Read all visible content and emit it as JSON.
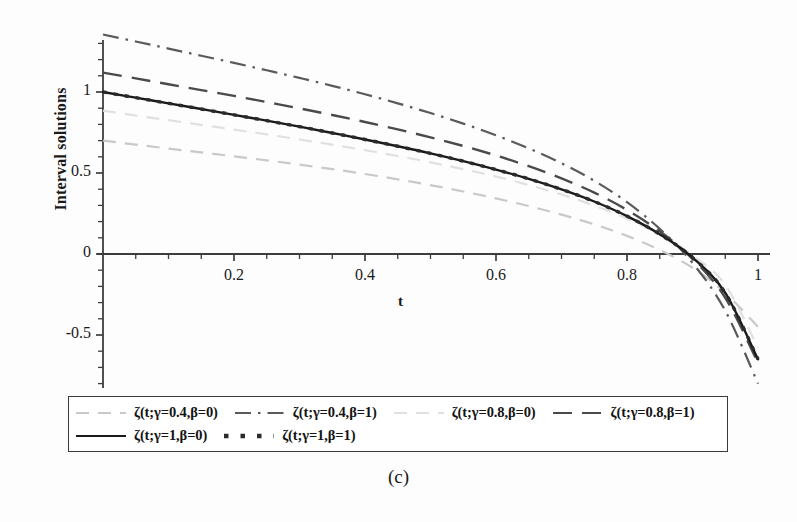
{
  "figure": {
    "caption": "(c)"
  },
  "chart_data": {
    "type": "line",
    "title": "",
    "xlabel": "t",
    "ylabel": "Interval solutions",
    "xlim": [
      0,
      1.02
    ],
    "ylim": [
      -0.86,
      1.42
    ],
    "grid": false,
    "legend_position": "bottom",
    "xticks": [
      {
        "value": 0.2,
        "label": "0.2"
      },
      {
        "value": 0.4,
        "label": "0.4"
      },
      {
        "value": 0.6,
        "label": "0.6"
      },
      {
        "value": 0.8,
        "label": "0.8"
      },
      {
        "value": 1.0,
        "label": "1"
      }
    ],
    "yticks": [
      {
        "value": 1.0,
        "label": "1"
      },
      {
        "value": 0.5,
        "label": "0.5"
      },
      {
        "value": 0.0,
        "label": "0"
      },
      {
        "value": -0.5,
        "label": "-0.5"
      }
    ],
    "x": [
      0,
      0.05,
      0.1,
      0.15,
      0.2,
      0.25,
      0.3,
      0.35,
      0.4,
      0.45,
      0.5,
      0.55,
      0.6,
      0.65,
      0.7,
      0.75,
      0.8,
      0.85,
      0.9,
      0.95,
      1.0
    ],
    "series": [
      {
        "name": "ζ(t;γ=0.4,β=0)",
        "style": "dashed",
        "color": "#c9c9c9",
        "width": 2.2,
        "values": [
          0.7,
          0.675,
          0.651,
          0.627,
          0.603,
          0.578,
          0.552,
          0.524,
          0.494,
          0.461,
          0.425,
          0.386,
          0.343,
          0.296,
          0.243,
          0.183,
          0.112,
          0.025,
          -0.085,
          -0.24,
          -0.45
        ]
      },
      {
        "name": "ζ(t;γ=0.4,β=1)",
        "style": "dashdot",
        "color": "#5a5a5a",
        "width": 2.2,
        "values": [
          1.355,
          1.312,
          1.268,
          1.224,
          1.18,
          1.134,
          1.087,
          1.038,
          0.986,
          0.93,
          0.87,
          0.805,
          0.733,
          0.652,
          0.56,
          0.452,
          0.32,
          0.155,
          -0.055,
          -0.35,
          -0.8
        ]
      },
      {
        "name": "ζ(t;γ=0.8,β=0)",
        "style": "dashed",
        "color": "#e0e0e0",
        "width": 2.2,
        "values": [
          0.885,
          0.855,
          0.826,
          0.797,
          0.768,
          0.738,
          0.707,
          0.675,
          0.641,
          0.605,
          0.566,
          0.524,
          0.478,
          0.426,
          0.367,
          0.299,
          0.218,
          0.118,
          -0.01,
          -0.19,
          -0.58
        ]
      },
      {
        "name": "ζ(t;γ=0.8,β=1)",
        "style": "longdash",
        "color": "#4a4a4a",
        "width": 2.4,
        "values": [
          1.12,
          1.084,
          1.048,
          1.012,
          0.976,
          0.938,
          0.899,
          0.858,
          0.815,
          0.769,
          0.72,
          0.667,
          0.608,
          0.542,
          0.467,
          0.379,
          0.272,
          0.14,
          -0.03,
          -0.27,
          -0.672
        ]
      },
      {
        "name": "ζ(t;γ=1,β=0)",
        "style": "solid",
        "color": "#1a1a1a",
        "width": 2.4,
        "values": [
          1.0,
          0.965,
          0.93,
          0.895,
          0.859,
          0.823,
          0.786,
          0.747,
          0.707,
          0.665,
          0.621,
          0.573,
          0.521,
          0.464,
          0.399,
          0.324,
          0.234,
          0.122,
          -0.022,
          -0.24,
          -0.65
        ]
      },
      {
        "name": "ζ(t;γ=1,β=1)",
        "style": "dotted-square",
        "color": "#2b2b2b",
        "width": 3.4,
        "values": [
          1.0,
          0.965,
          0.93,
          0.895,
          0.859,
          0.823,
          0.786,
          0.747,
          0.707,
          0.665,
          0.621,
          0.573,
          0.521,
          0.464,
          0.399,
          0.324,
          0.234,
          0.122,
          -0.022,
          -0.24,
          -0.65
        ]
      }
    ]
  },
  "legend": {
    "rows": [
      [
        {
          "label": "ζ(t;γ=0.4,β=0)",
          "style": "dashed",
          "color": "#c9c9c9"
        },
        {
          "label": "ζ(t;γ=0.4,β=1)",
          "style": "dashdot",
          "color": "#5a5a5a"
        },
        {
          "label": "ζ(t;γ=0.8,β=0)",
          "style": "dashed",
          "color": "#e0e0e0"
        },
        {
          "label": "ζ(t;γ=0.8,β=1)",
          "style": "longdash",
          "color": "#4a4a4a"
        }
      ],
      [
        {
          "label": "ζ(t;γ=1,β=0)",
          "style": "solid",
          "color": "#1a1a1a"
        },
        {
          "label": "ζ(t;γ=1,β=1)",
          "style": "dotted-square",
          "color": "#2b2b2b"
        }
      ]
    ]
  }
}
